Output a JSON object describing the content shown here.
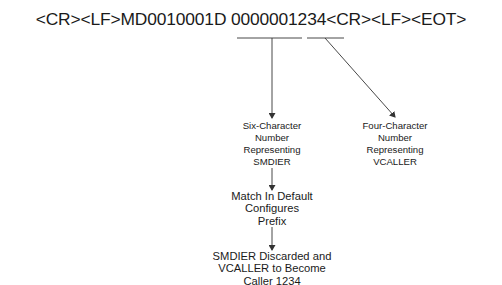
{
  "header": {
    "message": "<CR><LF>MD0010001D 0000001234<CR><LF><EOT>"
  },
  "boxes": {
    "six_char": {
      "lines": [
        "Six-Character",
        "Number",
        "Representing",
        "SMDIER"
      ]
    },
    "four_char": {
      "lines": [
        "Four-Character",
        "Number",
        "Representing",
        "VCALLER"
      ]
    },
    "match": {
      "lines": [
        "Match In Default",
        "Configures",
        "Prefix"
      ]
    },
    "result": {
      "lines": [
        "SMDIER Discarded and",
        "VCALLER to Become",
        "Caller 1234"
      ]
    }
  },
  "colors": {
    "line": "#333333",
    "text": "#1a1a1a"
  }
}
